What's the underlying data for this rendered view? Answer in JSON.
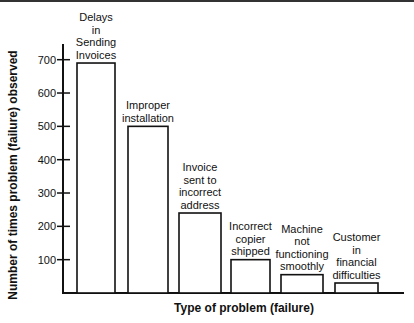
{
  "chart_data": {
    "type": "bar",
    "title": "",
    "xlabel": "Type of problem (failure)",
    "ylabel": "Number of times problem (failure) observed",
    "categories": [
      "Delays in Sending Invoices",
      "Improper installation",
      "Invoice sent to incorrect address",
      "Incorrect copier shipped",
      "Machine not functioning smoothly",
      "Customer in financial difficulties"
    ],
    "category_lines": [
      [
        "Delays",
        "in",
        "Sending",
        "Invoices"
      ],
      [
        "Improper",
        "installation"
      ],
      [
        "Invoice",
        "sent to",
        "incorrect",
        "address"
      ],
      [
        "Incorrect",
        "copier",
        "shipped"
      ],
      [
        "Machine",
        "not",
        "functioning",
        "smoothly"
      ],
      [
        "Customer",
        "in",
        "financial",
        "difficulties"
      ]
    ],
    "values": [
      690,
      500,
      240,
      100,
      55,
      30
    ],
    "yticks": [
      100,
      200,
      300,
      400,
      500,
      600,
      700
    ],
    "ylim": [
      0,
      750
    ],
    "grid": false,
    "legend": null
  }
}
